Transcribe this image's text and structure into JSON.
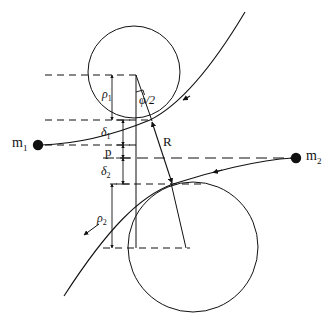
{
  "figure": {
    "kind": "two-body-scattering-diagram",
    "background_color": "#ffffff",
    "stroke_color": "#111111",
    "width": 334,
    "height": 320
  },
  "labels": {
    "mass_1": "m",
    "mass_1_sub": "1",
    "mass_2": "m",
    "mass_2_sub": "2",
    "rho_1": "ρ",
    "rho_1_sub": "1",
    "rho_2": "ρ",
    "rho_2_sub": "2",
    "delta_1": "δ",
    "delta_1_sub": "1",
    "delta_2": "δ",
    "delta_2_sub": "2",
    "impact_parameter": "p",
    "separation": "R",
    "half_angle": "φ/2"
  },
  "label_positions": {
    "mass_1": {
      "x": 12,
      "y": 138
    },
    "mass_2": {
      "x": 305,
      "y": 151
    },
    "rho_1": {
      "x": 103,
      "y": 89
    },
    "rho_2": {
      "x": 97,
      "y": 219
    },
    "delta_1": {
      "x": 101,
      "y": 128
    },
    "delta_2": {
      "x": 101,
      "y": 170
    },
    "impact_parameter": {
      "x": 104,
      "y": 148
    },
    "separation": {
      "x": 163,
      "y": 141
    },
    "half_angle": {
      "x": 139,
      "y": 95
    }
  },
  "geometry": {
    "circle_upper": {
      "cx": 134,
      "cy": 72,
      "r": 46
    },
    "circle_lower": {
      "cx": 193,
      "cy": 247,
      "r": 65
    },
    "mass_1_dot": {
      "cx": 38,
      "cy": 145,
      "r": 5
    },
    "mass_2_dot": {
      "cx": 296,
      "cy": 158,
      "r": 5
    },
    "contact_point_upper": {
      "x": 150,
      "y": 120
    },
    "contact_point_lower": {
      "x": 173,
      "y": 184
    },
    "vertex_upper": {
      "x": 136,
      "y": 75
    },
    "vertex_lower": {
      "x": 186,
      "y": 248
    },
    "vertical_axis_x": 136,
    "dimension_tick_x": 123,
    "dashed_line_y_top": 75,
    "dashed_line_y_rho1": 120,
    "dashed_line_y_m1": 145,
    "dashed_line_y_center": 158,
    "dashed_line_y_delta2": 184,
    "dashed_line_y_bottom": 248
  },
  "dimensions": [
    {
      "name": "rho_1",
      "from_y": 75,
      "to_y": 120,
      "x": 112
    },
    {
      "name": "delta_1",
      "from_y": 120,
      "to_y": 145,
      "x": 123
    },
    {
      "name": "impact_parameter",
      "from_y": 145,
      "to_y": 158,
      "x": 123
    },
    {
      "name": "delta_2",
      "from_y": 158,
      "to_y": 184,
      "x": 123
    },
    {
      "name": "rho_2",
      "from_y": 184,
      "to_y": 248,
      "x": 112
    }
  ]
}
